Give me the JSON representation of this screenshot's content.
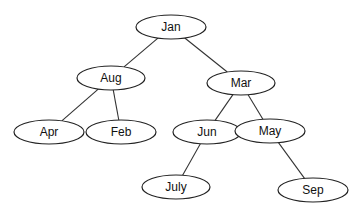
{
  "diagram": {
    "type": "binary-tree",
    "nodes": [
      {
        "id": "jan",
        "label": "Jan",
        "cx": 171,
        "cy": 27,
        "rx": 35,
        "ry": 12
      },
      {
        "id": "aug",
        "label": "Aug",
        "cx": 111,
        "cy": 78,
        "rx": 34,
        "ry": 12
      },
      {
        "id": "mar",
        "label": "Mar",
        "cx": 241,
        "cy": 83,
        "rx": 34,
        "ry": 12
      },
      {
        "id": "apr",
        "label": "Apr",
        "cx": 49,
        "cy": 132,
        "rx": 35,
        "ry": 12
      },
      {
        "id": "feb",
        "label": "Feb",
        "cx": 121,
        "cy": 132,
        "rx": 35,
        "ry": 12
      },
      {
        "id": "jun",
        "label": "Jun",
        "cx": 207,
        "cy": 132,
        "rx": 34,
        "ry": 12
      },
      {
        "id": "may",
        "label": "May",
        "cx": 270,
        "cy": 131,
        "rx": 35,
        "ry": 12
      },
      {
        "id": "july",
        "label": "July",
        "cx": 176,
        "cy": 187,
        "rx": 34,
        "ry": 12
      },
      {
        "id": "sep",
        "label": "Sep",
        "cx": 313,
        "cy": 190,
        "rx": 35,
        "ry": 12
      }
    ],
    "edges": [
      {
        "from": "jan",
        "to": "aug"
      },
      {
        "from": "jan",
        "to": "mar"
      },
      {
        "from": "aug",
        "to": "apr"
      },
      {
        "from": "aug",
        "to": "feb"
      },
      {
        "from": "mar",
        "to": "jun"
      },
      {
        "from": "mar",
        "to": "may"
      },
      {
        "from": "jun",
        "to": "july"
      },
      {
        "from": "may",
        "to": "sep"
      }
    ]
  }
}
